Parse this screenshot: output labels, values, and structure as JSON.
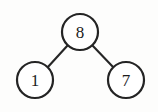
{
  "figure": {
    "background_color": "#fdfdfc",
    "width": 158,
    "height": 112
  },
  "chart_data": {
    "type": "diagram",
    "diagram_kind": "binary-tree",
    "title": "",
    "xlabel": "",
    "ylabel": "",
    "node_style": {
      "shape": "circle",
      "radius": 18,
      "fill": "#ffffff",
      "stroke": "#242424",
      "stroke_width": 2.2,
      "label_color": "#1c1c1c",
      "label_font_size": 17
    },
    "edge_style": {
      "stroke": "#262626",
      "stroke_width": 2.1,
      "kind": "straight"
    },
    "nodes": [
      {
        "id": "root",
        "label": "8",
        "role": "root",
        "cx": 80,
        "cy": 32
      },
      {
        "id": "left",
        "label": "1",
        "role": "left-child",
        "cx": 35,
        "cy": 80
      },
      {
        "id": "right",
        "label": "7",
        "role": "right-child",
        "cx": 126,
        "cy": 80
      }
    ],
    "edges": [
      {
        "from": "root",
        "to": "left",
        "x1": 68,
        "y1": 45,
        "x2": 47,
        "y2": 68
      },
      {
        "from": "root",
        "to": "right",
        "x1": 92,
        "y1": 45,
        "x2": 114,
        "y2": 68
      }
    ],
    "values": [
      8,
      1,
      7
    ],
    "categories": [
      "root",
      "left-child",
      "right-child"
    ]
  }
}
